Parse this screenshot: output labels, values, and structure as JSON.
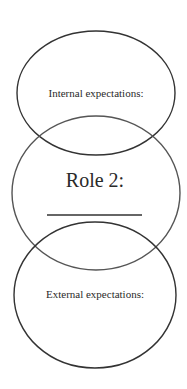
{
  "diagram": {
    "top_circle": {
      "label": "Internal expectations:"
    },
    "middle_circle": {
      "label": "Role 2:",
      "blank_line": true
    },
    "bottom_circle": {
      "label": "External expectations:"
    },
    "colors": {
      "stroke": "#333333",
      "middle_stroke": "#555555",
      "background": "#ffffff"
    }
  }
}
